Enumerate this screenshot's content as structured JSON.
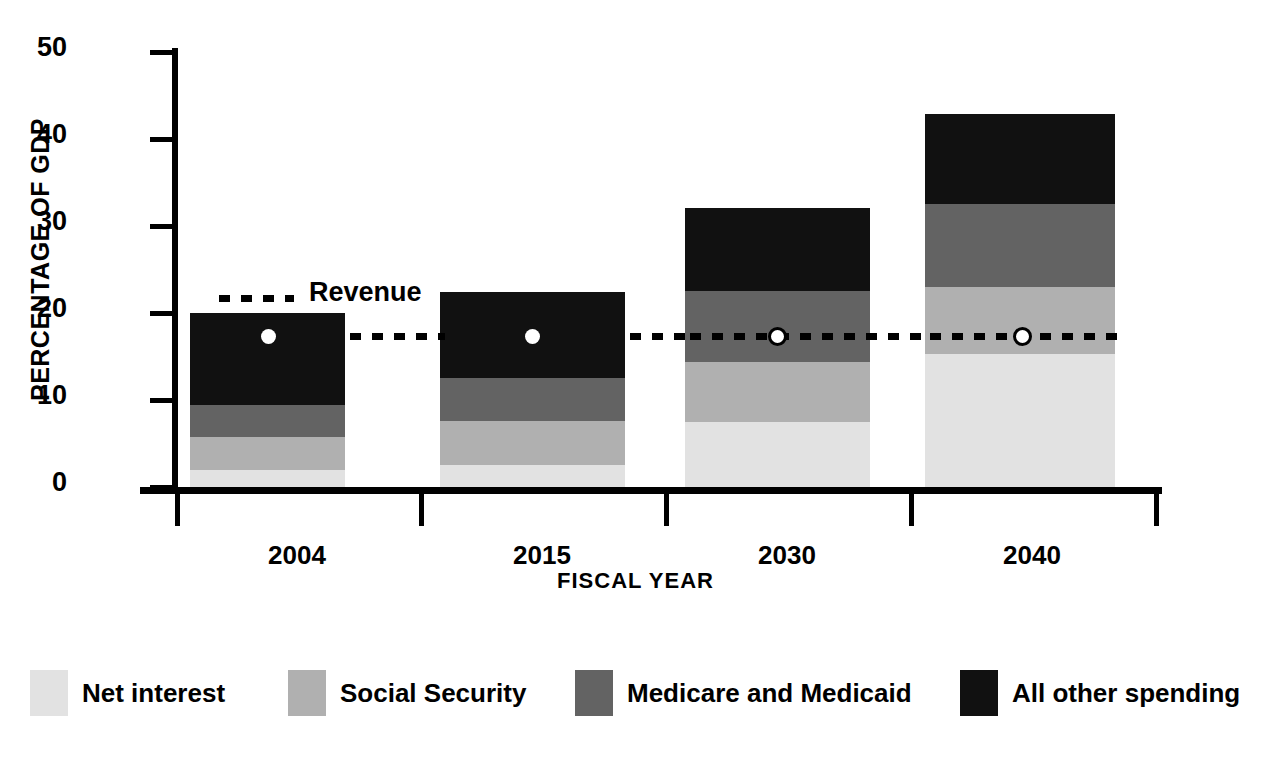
{
  "chart_data": {
    "type": "bar",
    "subtype": "stacked-bar-with-line-overlay",
    "title": "",
    "xlabel": "FISCAL YEAR",
    "ylabel": "PERCENTAGE OF GDP",
    "categories": [
      "2004",
      "2015",
      "2030",
      "2040"
    ],
    "ylim": [
      0,
      50
    ],
    "yticks": [
      0,
      10,
      20,
      30,
      40,
      50
    ],
    "ytick_labels": [
      "0",
      "10",
      "20",
      "30",
      "40",
      "50"
    ],
    "grid": false,
    "legend_position": "bottom",
    "series": [
      {
        "name": "Net interest",
        "color": "#e2e2e2",
        "values": [
          1.9,
          2.5,
          7.5,
          15.3
        ]
      },
      {
        "name": "Social Security",
        "color": "#b0b0b0",
        "values": [
          3.8,
          5.1,
          6.9,
          7.7
        ]
      },
      {
        "name": "Medicare and Medicaid",
        "color": "#636363",
        "values": [
          3.7,
          4.9,
          8.1,
          9.5
        ]
      },
      {
        "name": "All other spending",
        "color": "#111111",
        "values": [
          10.6,
          9.9,
          9.5,
          10.3
        ]
      }
    ],
    "totals": [
      20.0,
      22.4,
      32.0,
      42.8
    ],
    "overlay_line": {
      "name": "Revenue",
      "style": "dotted",
      "color": "#000000",
      "marker": "white-filled-circle",
      "values": [
        17.4,
        17.4,
        17.4,
        17.4
      ]
    }
  },
  "axes": {
    "y_title": "PERCENTAGE OF GDP",
    "x_title": "FISCAL YEAR",
    "y_ticks": [
      "50",
      "40",
      "30",
      "20",
      "10",
      "0"
    ],
    "x_ticks": [
      "2004",
      "2015",
      "2030",
      "2040"
    ]
  },
  "annotations": {
    "revenue_label": "Revenue"
  },
  "legend": {
    "items": [
      {
        "label": "Net interest",
        "color": "#e2e2e2"
      },
      {
        "label": "Social Security",
        "color": "#b0b0b0"
      },
      {
        "label": "Medicare and Medicaid",
        "color": "#636363"
      },
      {
        "label": "All other spending",
        "color": "#111111"
      }
    ]
  },
  "colors": {
    "background": "#ffffff",
    "foreground": "#000000",
    "net_interest": "#e2e2e2",
    "social_security": "#b0b0b0",
    "medicare_medicaid": "#636363",
    "all_other_spending": "#111111"
  }
}
